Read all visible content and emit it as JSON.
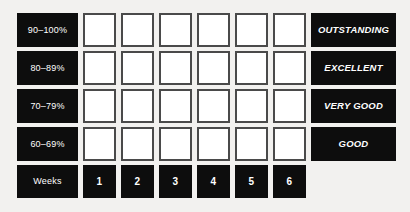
{
  "chart_data": {
    "type": "table",
    "row_labels": [
      "90–100%",
      "80–89%",
      "70–79%",
      "60–69%"
    ],
    "rating_labels": [
      "OUTSTANDING",
      "EXCELLENT",
      "VERY GOOD",
      "GOOD"
    ],
    "column_header_label": "Weeks",
    "columns": [
      "1",
      "2",
      "3",
      "4",
      "5",
      "6"
    ],
    "cells": [
      [
        "",
        "",
        "",
        "",
        "",
        ""
      ],
      [
        "",
        "",
        "",
        "",
        "",
        ""
      ],
      [
        "",
        "",
        "",
        "",
        "",
        ""
      ],
      [
        "",
        "",
        "",
        "",
        "",
        ""
      ]
    ],
    "grid": true,
    "legend": "none"
  },
  "colors": {
    "background": "#f2f1ef",
    "label_fill": "#0d0d0d",
    "label_text": "#ffffff",
    "box_fill": "#ffffff",
    "box_border": "#4a4a4a"
  },
  "rows": [
    {
      "range": "90–100%",
      "rating": "OUTSTANDING"
    },
    {
      "range": "80–89%",
      "rating": "EXCELLENT"
    },
    {
      "range": "70–79%",
      "rating": "VERY GOOD"
    },
    {
      "range": "60–69%",
      "rating": "GOOD"
    }
  ],
  "footer": {
    "label": "Weeks",
    "weeks": [
      "1",
      "2",
      "3",
      "4",
      "5",
      "6"
    ]
  }
}
